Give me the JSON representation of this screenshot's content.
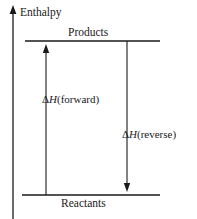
{
  "figure": {
    "type": "enthalpy-level-diagram",
    "background_color": "#ffffff",
    "line_color": "#1a1a1a",
    "axis": {
      "label": "Enthalpy",
      "orientation": "vertical",
      "arrow": "up",
      "x": 13,
      "top_y": 8,
      "bottom_y": 219
    },
    "levels": [
      {
        "name": "products",
        "label": "Products",
        "label_position": "above",
        "y": 41,
        "x_start": 25,
        "x_end": 160
      },
      {
        "name": "reactants",
        "label": "Reactants",
        "label_position": "below",
        "y": 195,
        "x_start": 22,
        "x_end": 160
      }
    ],
    "arrows": [
      {
        "name": "forward",
        "delta_symbol": "Δ",
        "variable": "H",
        "direction_text": "(forward)",
        "label_text": "ΔH(forward)",
        "points": "up",
        "x": 46,
        "from_y": 195,
        "to_y": 45
      },
      {
        "name": "reverse",
        "delta_symbol": "Δ",
        "variable": "H",
        "direction_text": "(reverse)",
        "label_text": "ΔH(reverse)",
        "points": "down",
        "x": 127,
        "from_y": 41,
        "to_y": 191
      }
    ]
  }
}
